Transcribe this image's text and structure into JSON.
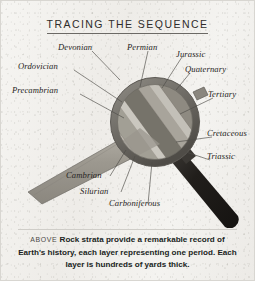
{
  "figure": {
    "title": "TRACING THE SEQUENCE",
    "caption_above_label": "ABOVE",
    "caption_text": "Rock strata provide a remarkable record of Earth's history, each layer representing one period.  Each layer is hundreds of yards thick."
  },
  "illustration": {
    "subject": "magnifying-glass-over-rock-strata",
    "colors": {
      "paper": "#f3f2ef",
      "lens_rim": "#7d7a73",
      "lens_glass": "#a9a59c",
      "handle": "#2a2724",
      "strata_band": "#9e9a91",
      "leader_line": "#4d4b47",
      "text": "#272523"
    }
  },
  "labels": [
    {
      "id": "devonian",
      "text": "Devonian"
    },
    {
      "id": "permian",
      "text": "Permian"
    },
    {
      "id": "jurassic",
      "text": "Jurassic"
    },
    {
      "id": "quaternary",
      "text": "Quaternary"
    },
    {
      "id": "ordovician",
      "text": "Ordovician"
    },
    {
      "id": "tertiary",
      "text": "Tertiary"
    },
    {
      "id": "precambrian",
      "text": "Precambrian"
    },
    {
      "id": "cretaceous",
      "text": "Cretaceous"
    },
    {
      "id": "triassic",
      "text": "Triassic"
    },
    {
      "id": "cambrian",
      "text": "Cambrian"
    },
    {
      "id": "silurian",
      "text": "Silurian"
    },
    {
      "id": "carboniferous",
      "text": "Carboniferous"
    }
  ]
}
